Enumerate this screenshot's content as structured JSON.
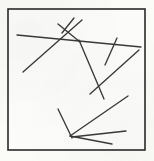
{
  "figure": {
    "kind": "line-segment-sketch",
    "canvas": {
      "width": 154,
      "height": 161
    },
    "background_color": "#fdfdfb",
    "ink_color": "#3a3a3a",
    "frame_color": "#2a2a2a",
    "frame": {
      "x": 8,
      "y": 9,
      "width": 137,
      "height": 141,
      "stroke_width": 1.6
    },
    "segment_count": 10,
    "segments": [
      {
        "name": "long-shallow-horizontal",
        "x1": 17,
        "y1": 35,
        "x2": 141,
        "y2": 47
      },
      {
        "name": "low-left-to-upper-right-diagonal",
        "x1": 23,
        "y1": 72,
        "x2": 82,
        "y2": 20
      },
      {
        "name": "short-steep-top-left-cross",
        "x1": 58,
        "y1": 24,
        "x2": 80,
        "y2": 42
      },
      {
        "name": "short-steep-top-right-cross",
        "x1": 74,
        "y1": 18,
        "x2": 62,
        "y2": 33
      },
      {
        "name": "top-center-to-lower-right-long-diagonal",
        "x1": 79,
        "y1": 40,
        "x2": 104,
        "y2": 99
      },
      {
        "name": "right-short-steep-tick",
        "x1": 117,
        "y1": 38,
        "x2": 105,
        "y2": 65
      },
      {
        "name": "mid-right-rising-diagonal",
        "x1": 90,
        "y1": 94,
        "x2": 139,
        "y2": 50
      },
      {
        "name": "lower-right-falling-long-diagonal",
        "x1": 128,
        "y1": 96,
        "x2": 70,
        "y2": 136
      },
      {
        "name": "bottom-left-steep-descender",
        "x1": 58,
        "y1": 109,
        "x2": 72,
        "y2": 138
      },
      {
        "name": "bottom-shallow-tail",
        "x1": 70,
        "y1": 136,
        "x2": 112,
        "y2": 144
      },
      {
        "name": "lower-center-rising-to-right-edge",
        "x1": 72,
        "y1": 137,
        "x2": 126,
        "y2": 131
      }
    ]
  }
}
